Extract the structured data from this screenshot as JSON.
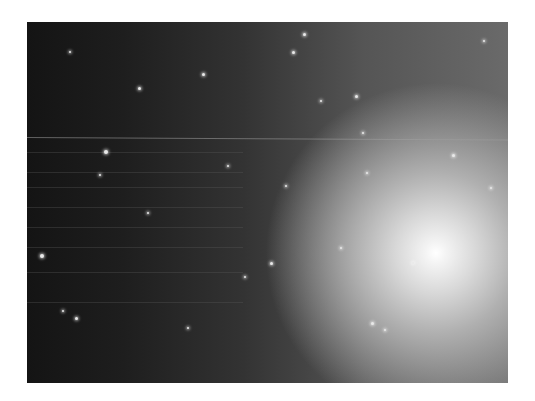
{
  "image": {
    "subject": "galaxy-starfield",
    "description": "Grayscale astronomical photograph of a bright elliptical galaxy core at lower right surrounded by a dense field of stars, with a faint horizontal streak across the upper-middle."
  }
}
